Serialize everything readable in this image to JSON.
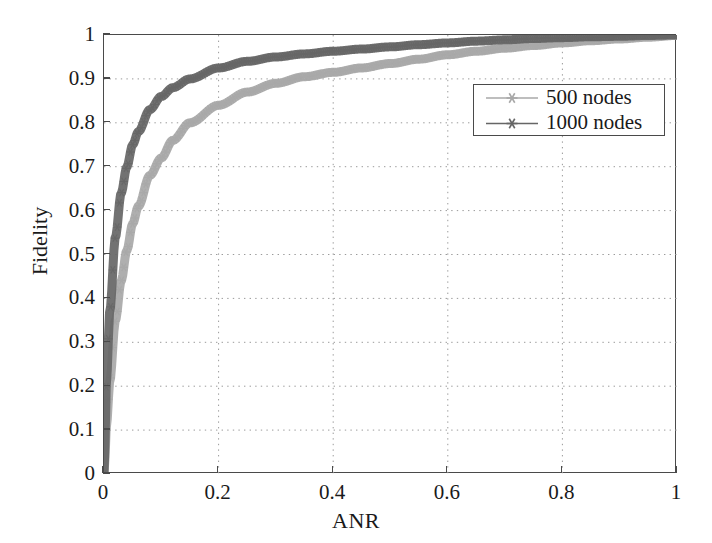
{
  "chart_data": {
    "type": "line",
    "title": "",
    "xlabel": "ANR",
    "ylabel": "Fidelity",
    "xlim": [
      0,
      1
    ],
    "ylim": [
      0,
      1
    ],
    "xticks": [
      "0",
      "0.2",
      "0.4",
      "0.6",
      "0.8",
      "1"
    ],
    "xtick_values": [
      0,
      0.2,
      0.4,
      0.6,
      0.8,
      1
    ],
    "yticks": [
      "0",
      "0.1",
      "0.2",
      "0.3",
      "0.4",
      "0.5",
      "0.6",
      "0.7",
      "0.8",
      "0.9",
      "1"
    ],
    "ytick_values": [
      0,
      0.1,
      0.2,
      0.3,
      0.4,
      0.5,
      0.6,
      0.7,
      0.8,
      0.9,
      1
    ],
    "grid": true,
    "grid_style": "dotted",
    "legend_position": "upper right",
    "marker": "asterisk",
    "x": [
      0,
      0.005,
      0.01,
      0.02,
      0.03,
      0.04,
      0.05,
      0.06,
      0.08,
      0.1,
      0.12,
      0.15,
      0.2,
      0.25,
      0.3,
      0.35,
      0.4,
      0.45,
      0.5,
      0.55,
      0.6,
      0.65,
      0.7,
      0.75,
      0.8,
      0.85,
      0.9,
      0.95,
      1
    ],
    "series": [
      {
        "name": "500 nodes",
        "color": "#a8a8a8",
        "values": [
          0,
          0.12,
          0.21,
          0.35,
          0.44,
          0.51,
          0.57,
          0.61,
          0.68,
          0.72,
          0.76,
          0.8,
          0.84,
          0.87,
          0.89,
          0.905,
          0.915,
          0.925,
          0.935,
          0.945,
          0.955,
          0.963,
          0.97,
          0.976,
          0.982,
          0.987,
          0.991,
          0.995,
          0.999
        ]
      },
      {
        "name": "1000 nodes",
        "color": "#666666",
        "values": [
          0,
          0.23,
          0.37,
          0.54,
          0.64,
          0.7,
          0.75,
          0.78,
          0.83,
          0.86,
          0.88,
          0.9,
          0.925,
          0.94,
          0.95,
          0.957,
          0.963,
          0.968,
          0.973,
          0.978,
          0.982,
          0.986,
          0.989,
          0.992,
          0.994,
          0.996,
          0.997,
          0.999,
          1
        ]
      }
    ],
    "legend_entries": [
      {
        "label": "500 nodes",
        "color": "#a8a8a8"
      },
      {
        "label": "1000 nodes",
        "color": "#666666"
      }
    ]
  },
  "axes": {
    "x_title": "ANR",
    "y_title": "Fidelity"
  },
  "colors": {
    "axis": "#4a4a4a",
    "grid": "#9a9a9a",
    "background": "#ffffff",
    "series_500": "#a8a8a8",
    "series_1000": "#666666"
  }
}
